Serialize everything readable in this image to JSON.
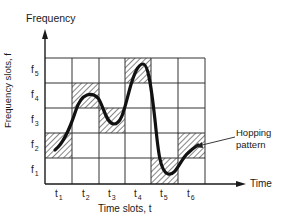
{
  "diagram": {
    "y_axis_title": "Frequency",
    "y_axis_label": "Frequency slots, f",
    "x_axis_title": "Time",
    "x_axis_label": "Time slots, t",
    "annotation": "Hopping\npattern",
    "annotation_line1": "Hopping",
    "annotation_line2": "pattern",
    "frequency_slots": [
      {
        "base": "f",
        "sub": "1"
      },
      {
        "base": "f",
        "sub": "2"
      },
      {
        "base": "f",
        "sub": "3"
      },
      {
        "base": "f",
        "sub": "4"
      },
      {
        "base": "f",
        "sub": "5"
      }
    ],
    "time_slots": [
      {
        "base": "t",
        "sub": "1"
      },
      {
        "base": "t",
        "sub": "2"
      },
      {
        "base": "t",
        "sub": "3"
      },
      {
        "base": "t",
        "sub": "4"
      },
      {
        "base": "t",
        "sub": "5"
      },
      {
        "base": "t",
        "sub": "6"
      }
    ],
    "hatched_cells": [
      {
        "time": "t1",
        "freq": "f2"
      },
      {
        "time": "t2",
        "freq": "f4"
      },
      {
        "time": "t3",
        "freq": "f3"
      },
      {
        "time": "t4",
        "freq": "f5"
      },
      {
        "time": "t5",
        "freq": "f1"
      },
      {
        "time": "t6",
        "freq": "f2"
      }
    ],
    "colors": {
      "ink": "#1a1a1a",
      "grid": "#333333",
      "background": "#ffffff"
    }
  }
}
